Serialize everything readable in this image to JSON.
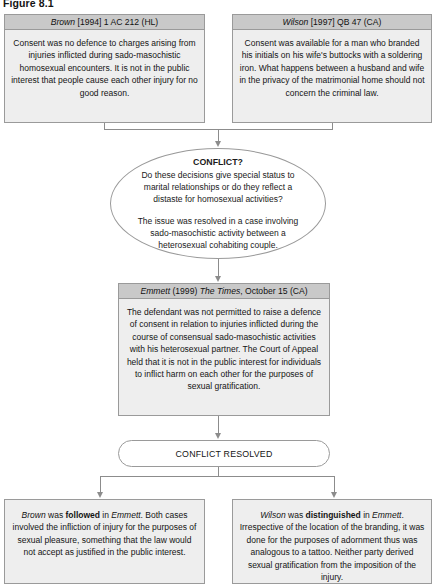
{
  "figure": {
    "caption": "Figure 8.1"
  },
  "boxes": {
    "brown": {
      "header_case": "Brown",
      "header_citation": " [1994] 1 AC 212 (HL)",
      "body": "Consent was no defence to charges arising from injuries inflicted during sado-masochistic homosexual encounters. It is not in the public interest that people cause each other injury for no good reason."
    },
    "wilson": {
      "header_case": "Wilson",
      "header_citation": " [1997] QB 47 (CA)",
      "body": "Consent was available for a man who branded his initials on his wife's buttocks with a soldering iron. What happens between a husband and wife in the privacy of the matrimonial home should not concern the criminal law."
    },
    "emmett": {
      "header_case": "Emmett",
      "header_mid": " (1999) ",
      "header_source": "The Times",
      "header_tail": ", October 15 (CA)",
      "body": "The defendant was not permitted to raise a defence of consent in relation to injuries inflicted during the course of consensual sado-masochistic activities with his heterosexual partner. The Court of Appeal held that it is not in the public interest for individuals to inflict harm on each other for the purposes of sexual gratification."
    },
    "brown_result": {
      "lead_case": "Brown",
      "lead_mid": " was ",
      "lead_emphasis": "followed",
      "lead_in": " in ",
      "lead_case2": "Emmett",
      "lead_end": ".",
      "body": "Both cases involved the infliction of injury for the purposes of sexual pleasure, something that the law would not accept as justified in the public interest."
    },
    "wilson_result": {
      "lead_case": "Wilson",
      "lead_mid": " was ",
      "lead_emphasis": "distinguished",
      "lead_in": " in ",
      "lead_case2": "Emmett",
      "lead_end": ".",
      "body": "Irrespective of the location of the branding, it was done for the purposes of adornment thus was analogous to a tattoo. Neither party derived sexual gratification from the imposition of the injury."
    }
  },
  "conflict": {
    "title": "CONFLICT?",
    "question": "Do these decisions give special status to marital relationships or do they reflect a distaste for homosexual activities?",
    "resolution_note": "The issue was resolved in a case involving sado-masochistic activity between a heterosexual cohabiting couple."
  },
  "resolved": {
    "label": "CONFLICT RESOLVED"
  },
  "colors": {
    "header_fill": "#c9c9c9",
    "body_fill": "#eeeeee",
    "border": "#9a9a9a",
    "connector": "#8c8c8c",
    "text": "#141414"
  }
}
